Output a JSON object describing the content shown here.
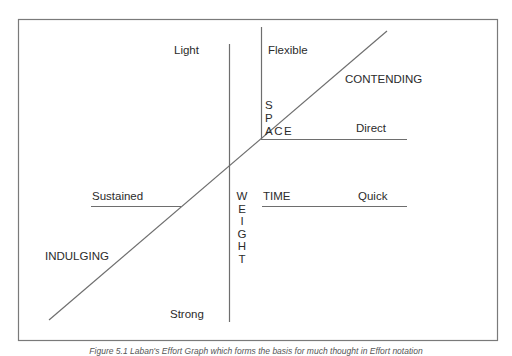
{
  "diagram": {
    "type": "effort-graph",
    "colors": {
      "line": "#6e6e6e",
      "text": "#2b2b2b",
      "frame": "#7a7a7a",
      "background": "#ffffff"
    },
    "axes": {
      "weight": {
        "name": "WEIGHT",
        "letters": [
          "W",
          "E",
          "I",
          "G",
          "H",
          "T"
        ],
        "top_label": "Light",
        "bottom_label": "Strong"
      },
      "space": {
        "name_top": [
          "S",
          "P"
        ],
        "name_rest": "ACE",
        "top_label": "Flexible",
        "right_label": "Direct"
      },
      "time": {
        "name": "TIME",
        "right_label": "Quick",
        "left_label": "Sustained"
      },
      "flow_diagonal": {
        "upper_label": "CONTENDING",
        "lower_label": "INDULGING"
      }
    },
    "labels": {
      "light": "Light",
      "strong": "Strong",
      "flexible": "Flexible",
      "direct": "Direct",
      "contending": "CONTENDING",
      "indulging": "INDULGING",
      "sustained": "Sustained",
      "time": "TIME",
      "quick": "Quick",
      "space_s": "S",
      "space_p": "P",
      "space_ace": "ACE",
      "weight_letters": [
        "W",
        "E",
        "I",
        "G",
        "H",
        "T"
      ]
    },
    "caption": "Figure 5.1 Laban's Effort Graph which forms the basis for much thought in Effort notation"
  }
}
